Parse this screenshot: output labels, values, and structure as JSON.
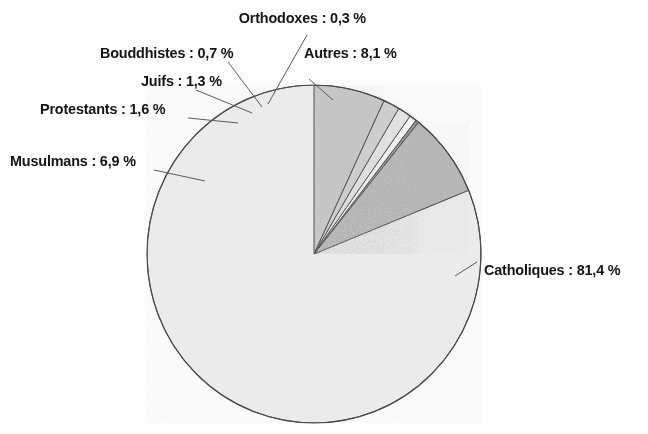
{
  "chart_data": {
    "type": "pie",
    "title": "",
    "subtitle": "",
    "xlabel": "",
    "ylabel": "",
    "legend_position": "none",
    "grid": false,
    "unit": "%",
    "decimal_separator": ",",
    "start_angle_deg": 0,
    "direction": "counterclockwise",
    "categories": [
      "Catholiques",
      "Autres",
      "Orthodoxes",
      "Bouddhistes",
      "Juifs",
      "Protestants",
      "Musulmans"
    ],
    "values": [
      81.4,
      8.1,
      0.3,
      0.7,
      1.3,
      1.6,
      6.9
    ],
    "slices": [
      {
        "name": "Catholiques",
        "value": 81.4,
        "value_text": "81,4 %",
        "label": "Catholiques : 81,4 %",
        "color": "#ededed",
        "stroke": "#4a4a4a"
      },
      {
        "name": "Autres",
        "value": 8.1,
        "value_text": "8,1 %",
        "label": "Autres : 8,1 %",
        "color": "#b6b6b6",
        "stroke": "#4a4a4a"
      },
      {
        "name": "Orthodoxes",
        "value": 0.3,
        "value_text": "0,3 %",
        "label": "Orthodoxes : 0,3 %",
        "color": "#8f8f8f",
        "stroke": "#3c3c3c"
      },
      {
        "name": "Bouddhistes",
        "value": 0.7,
        "value_text": "0,7 %",
        "label": "Bouddhistes : 0,7 %",
        "color": "#fafafa",
        "stroke": "#3c3c3c"
      },
      {
        "name": "Juifs",
        "value": 1.3,
        "value_text": "1,3 %",
        "label": "Juifs : 1,3 %",
        "color": "#e4e4e4",
        "stroke": "#4a4a4a"
      },
      {
        "name": "Protestants",
        "value": 1.6,
        "value_text": "1,6 %",
        "label": "Protestants : 1,6 %",
        "color": "#cfcfcf",
        "stroke": "#4a4a4a"
      },
      {
        "name": "Musulmans",
        "value": 6.9,
        "value_text": "6,9 %",
        "label": "Musulmans : 6,9 %",
        "color": "#c6c6c6",
        "stroke": "#4a4a4a"
      }
    ]
  },
  "labels": {
    "orthodoxes": "Orthodoxes : 0,3 %",
    "bouddhistes": "Bouddhistes : 0,7 %",
    "juifs": "Juifs : 1,3 %",
    "protestants": "Protestants : 1,6 %",
    "musulmans": "Musulmans : 6,9 %",
    "autres": "Autres : 8,1 %",
    "catholiques": "Catholiques : 81,4 %"
  }
}
